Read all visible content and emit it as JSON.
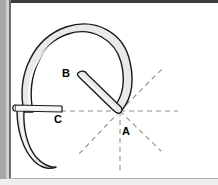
{
  "figure": {
    "canvas": {
      "width": 218,
      "height": 185
    },
    "background_color": "#ffffff",
    "page_edge_color": "#a8a8a8",
    "page_border_color": "#3b3b3b",
    "bottom_band_color": "#efefef",
    "outline_color": "#1a1a1a",
    "fill_color": "#e9e9e9",
    "highlight_color": "#ffffff",
    "dash_color": "#8c8c8c",
    "labels": [
      {
        "id": "label-a",
        "text": "A",
        "x": 122,
        "y": 135
      },
      {
        "id": "label-b",
        "text": "B",
        "x": 66,
        "y": 77
      },
      {
        "id": "label-c",
        "text": "C",
        "x": 58,
        "y": 123
      }
    ],
    "vertex": {
      "x": 120,
      "y": 111
    },
    "rays": [
      {
        "id": "ray-horizontal-left",
        "x1": 120,
        "y1": 111,
        "x2": 58,
        "y2": 111
      },
      {
        "id": "ray-horizontal-right",
        "x1": 120,
        "y1": 111,
        "x2": 178,
        "y2": 111
      },
      {
        "id": "ray-upper-right",
        "x1": 120,
        "y1": 111,
        "x2": 163,
        "y2": 68
      },
      {
        "id": "ray-lower-right",
        "x1": 120,
        "y1": 111,
        "x2": 161,
        "y2": 151
      },
      {
        "id": "ray-lower-left",
        "x1": 120,
        "y1": 111,
        "x2": 78,
        "y2": 155
      },
      {
        "id": "ray-vertical-down",
        "x1": 120,
        "y1": 111,
        "x2": 120,
        "y2": 172
      }
    ],
    "parts": [
      {
        "id": "arch-body",
        "description": "Large curved arch forming the outer hook"
      },
      {
        "id": "lower-tail",
        "description": "Curved tail descending from the left leg"
      },
      {
        "id": "cross-bar",
        "description": "Horizontal bar crossing the left leg at point C"
      },
      {
        "id": "diagonal-strut",
        "description": "Diagonal strut running from B down to the vertex at A"
      }
    ]
  }
}
